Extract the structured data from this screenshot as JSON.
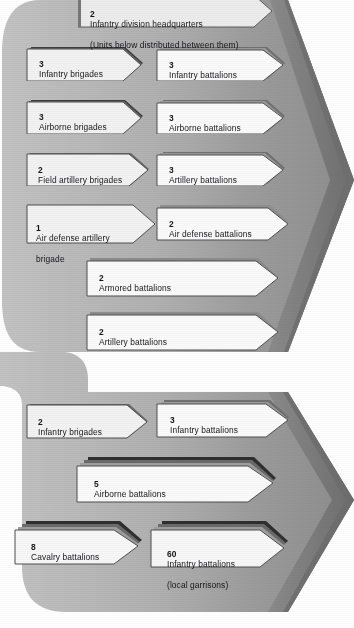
{
  "figure": {
    "type": "organizational-arrow-diagram",
    "colors": {
      "panel_light": "#b9b9b9",
      "panel_mid": "#9a9a9a",
      "panel_dark": "#6f6f6f",
      "arrow_fill": "#ececec",
      "arrow_fill_white": "#f7f7f7",
      "arrow_edge": "#555555",
      "arrow_shadow": "#3a3a3a",
      "text": "#16161a",
      "background": "#ffffff"
    }
  },
  "sections": [
    {
      "name": "division-section",
      "header": {
        "count": "2",
        "label": "Infantry division headquarters",
        "sublabel": "(Units below distributed between them)"
      },
      "left_column": [
        {
          "count": "3",
          "label": "Infantry brigades",
          "stack": 3
        },
        {
          "count": "3",
          "label": "Airborne brigades",
          "stack": 3
        },
        {
          "count": "2",
          "label": "Field artillery brigades",
          "stack": 2
        },
        {
          "count": "1",
          "label": "Air defense artillery",
          "label2": "brigade",
          "stack": 1
        }
      ],
      "right_column": [
        {
          "count": "3",
          "label": "Infantry battalions",
          "stack": 3
        },
        {
          "count": "3",
          "label": "Airborne battalions",
          "stack": 3
        },
        {
          "count": "3",
          "label": "Artillery battalions",
          "stack": 3
        },
        {
          "count": "2",
          "label": "Air defense battalions",
          "stack": 2
        }
      ],
      "wide_rows": [
        {
          "count": "2",
          "label": "Armored battalions",
          "stack": 2
        },
        {
          "count": "2",
          "label": "Artillery battalions",
          "stack": 2
        }
      ]
    },
    {
      "name": "territorial-section",
      "left_column": [
        {
          "count": "2",
          "label": "Infantry brigades",
          "stack": 2
        },
        {
          "count": "8",
          "label": "Cavalry battalions",
          "stack": 3
        }
      ],
      "right_column": [
        {
          "count": "3",
          "label": "Infantry battalions",
          "stack": 3
        },
        {
          "count": "60",
          "label": "Infantry battalions",
          "label2": "(local garrisons)",
          "stack": 3
        }
      ],
      "wide_rows": [
        {
          "count": "5",
          "label": "Airborne battalions",
          "stack": 3
        }
      ]
    }
  ]
}
